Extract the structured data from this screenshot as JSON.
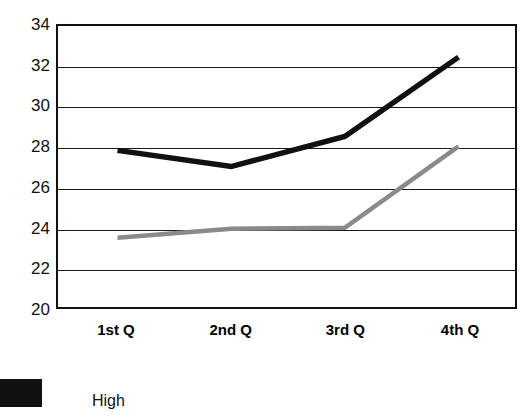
{
  "chart_data": {
    "type": "line",
    "title": "",
    "subtitle": "",
    "xlabel": "",
    "ylabel": "",
    "categories": [
      "1st Q",
      "2nd Q",
      "3rd Q",
      "4th Q"
    ],
    "ylim": [
      20,
      34
    ],
    "yticks": [
      20,
      22,
      24,
      26,
      28,
      30,
      32,
      34
    ],
    "ytick_labels": [
      "20",
      "22",
      "24",
      "26",
      "28",
      "30",
      "32",
      "34"
    ],
    "grid": "horizontal",
    "legend_position": "bottom-left",
    "series": [
      {
        "name": "High",
        "color": "#111111",
        "values": [
          27.8,
          27.0,
          28.5,
          32.45
        ]
      },
      {
        "name": "",
        "color": "#8a8a8a",
        "values": [
          23.45,
          23.9,
          23.95,
          28.0
        ]
      }
    ]
  },
  "legend": {
    "entries": [
      {
        "label": "High",
        "color": "#111111"
      }
    ]
  },
  "colors": {
    "axis": "#111111",
    "grid": "#1a1a1a",
    "background": "#ffffff",
    "series_high": "#111111",
    "series_low": "#8a8a8a"
  }
}
